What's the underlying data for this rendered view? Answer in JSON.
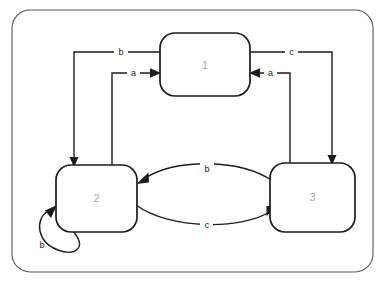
{
  "diagram": {
    "type": "state-transition-diagram",
    "title": "",
    "background_color": "#ffffff",
    "frame": {
      "name": "outer-frame",
      "stroke_color": "#555558",
      "x": 12,
      "y": 10,
      "width": 361,
      "height": 262,
      "corner_radius": 18
    },
    "node_stroke_color": "#1c1c1c",
    "node_fill_color": "#ffffff",
    "node_label_color": "#a9a9ad",
    "edge_color": "#1c1c1c",
    "states": [
      {
        "id": "1",
        "label": "1",
        "x": 160,
        "y": 33,
        "width": 90,
        "height": 63,
        "corner_radius": 15,
        "center_x": 205,
        "center_y": 65
      },
      {
        "id": "2",
        "label": "2",
        "x": 56,
        "y": 165,
        "width": 81,
        "height": 67,
        "corner_radius": 15,
        "center_x": 96,
        "center_y": 198
      },
      {
        "id": "3",
        "label": "3",
        "x": 270,
        "y": 163,
        "width": 85,
        "height": 69,
        "corner_radius": 15,
        "center_x": 312,
        "center_y": 197
      }
    ],
    "transitions": [
      {
        "id": "t1",
        "label": "b",
        "from": "1",
        "to": "2",
        "shape": "orthogonal",
        "path": "M 160 52 L 74 52 L 74 160",
        "label_x": 121,
        "label_y": 52,
        "arrow": {
          "x": 74,
          "y": 166,
          "direction": "down"
        }
      },
      {
        "id": "t2",
        "label": "a",
        "from": "2",
        "to": "1",
        "shape": "orthogonal",
        "path": "M 112 168 L 112 73 L 154 73",
        "label_x": 133,
        "label_y": 73,
        "arrow": {
          "x": 160,
          "y": 73,
          "direction": "right"
        }
      },
      {
        "id": "t3",
        "label": "c",
        "from": "1",
        "to": "3",
        "shape": "orthogonal",
        "path": "M 250 52 L 332 52 L 332 157",
        "label_x": 291,
        "label_y": 52,
        "arrow": {
          "x": 332,
          "y": 163,
          "direction": "down"
        }
      },
      {
        "id": "t4",
        "label": "a",
        "from": "3",
        "to": "1",
        "shape": "orthogonal",
        "path": "M 290 168 L 290 73 L 256 73",
        "label_x": 270,
        "label_y": 73,
        "arrow": {
          "x": 250,
          "y": 73,
          "direction": "left"
        }
      },
      {
        "id": "t5",
        "label": "b",
        "from": "3",
        "to": "2",
        "shape": "arc",
        "path": "M 272 180 C 238 160 175 160 143 179",
        "label_x": 207,
        "label_y": 170,
        "arrow": {
          "x": 137,
          "y": 183,
          "direction": "left-down"
        }
      },
      {
        "id": "t6",
        "label": "c",
        "from": "2",
        "to": "3",
        "shape": "arc",
        "path": "M 137 208 C 172 232 240 232 272 212",
        "label_x": 207,
        "label_y": 225,
        "arrow": {
          "x": 277,
          "y": 208,
          "direction": "right-up"
        }
      },
      {
        "id": "t7",
        "label": "b",
        "from": "2",
        "to": "2",
        "shape": "self-loop",
        "path": "M 70 230 C 90 250 72 257 52 246 C 36 236 38 216 50 209",
        "label_x": 43,
        "label_y": 245,
        "arrow": {
          "x": 56,
          "y": 206,
          "direction": "up-right"
        }
      }
    ],
    "alphabet": [
      "a",
      "b",
      "c"
    ]
  }
}
